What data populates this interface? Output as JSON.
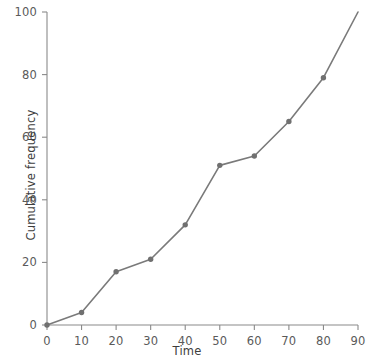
{
  "chart_data": {
    "type": "line",
    "title": "",
    "subtitle": "",
    "xlabel": "Time",
    "ylabel": "Cumulative frequency",
    "xlim": [
      0,
      90
    ],
    "ylim": [
      0,
      100
    ],
    "xticks": [
      0,
      10,
      20,
      30,
      40,
      50,
      60,
      70,
      80,
      90
    ],
    "yticks": [
      0,
      20,
      40,
      60,
      80,
      100
    ],
    "xtick_labels": [
      "0",
      "10",
      "20",
      "30",
      "40",
      "50",
      "60",
      "70",
      "80",
      "90"
    ],
    "ytick_labels": [
      "0",
      "20",
      "40",
      "60",
      "80",
      "100"
    ],
    "grid": false,
    "legend": null,
    "legend_position": "none",
    "series": [
      {
        "name": "Cumulative frequency",
        "color": "#7a7a7a",
        "marker": "circle",
        "x": [
          0,
          10,
          20,
          30,
          40,
          50,
          60,
          70,
          80,
          90
        ],
        "values": [
          0,
          4,
          17,
          21,
          32,
          51,
          54,
          65,
          79,
          100
        ],
        "marker_x": [
          0,
          10,
          20,
          30,
          40,
          50,
          60,
          70,
          80
        ],
        "marker_values": [
          0,
          4,
          17,
          21,
          32,
          51,
          54,
          65,
          79
        ]
      }
    ],
    "annotations": []
  },
  "colors": {
    "line": "#7a7a7a",
    "marker": "#707070",
    "axis": "#8a8a8a",
    "tick_text": "#5a5a5a",
    "label_text": "#3d3d3d",
    "background": "#ffffff"
  }
}
